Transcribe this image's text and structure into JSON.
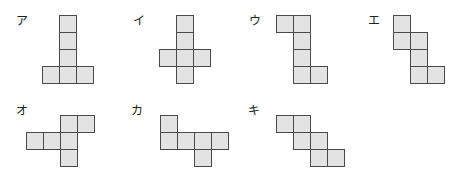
{
  "cell_size": 17,
  "fill_color": "#e3e3e3",
  "border_color": "#4a4a4a",
  "shapes": [
    {
      "label": "ア",
      "label_pos": [
        16,
        14
      ],
      "origin": [
        42,
        15
      ],
      "cells": [
        [
          1,
          0
        ],
        [
          1,
          1
        ],
        [
          1,
          2
        ],
        [
          0,
          3
        ],
        [
          1,
          3
        ],
        [
          2,
          3
        ]
      ]
    },
    {
      "label": "イ",
      "label_pos": [
        133,
        14
      ],
      "origin": [
        159,
        15
      ],
      "cells": [
        [
          1,
          0
        ],
        [
          1,
          1
        ],
        [
          0,
          2
        ],
        [
          1,
          2
        ],
        [
          2,
          2
        ],
        [
          1,
          3
        ]
      ]
    },
    {
      "label": "ウ",
      "label_pos": [
        249,
        14
      ],
      "origin": [
        276,
        15
      ],
      "cells": [
        [
          0,
          0
        ],
        [
          1,
          0
        ],
        [
          1,
          1
        ],
        [
          1,
          2
        ],
        [
          1,
          3
        ],
        [
          2,
          3
        ]
      ]
    },
    {
      "label": "エ",
      "label_pos": [
        368,
        14
      ],
      "origin": [
        393,
        15
      ],
      "cells": [
        [
          0,
          0
        ],
        [
          0,
          1
        ],
        [
          1,
          1
        ],
        [
          1,
          2
        ],
        [
          1,
          3
        ],
        [
          2,
          3
        ]
      ]
    },
    {
      "label": "オ",
      "label_pos": [
        16,
        104
      ],
      "origin": [
        26,
        115
      ],
      "cells": [
        [
          2,
          0
        ],
        [
          3,
          0
        ],
        [
          0,
          1
        ],
        [
          1,
          1
        ],
        [
          2,
          1
        ],
        [
          2,
          2
        ]
      ]
    },
    {
      "label": "カ",
      "label_pos": [
        131,
        104
      ],
      "origin": [
        160,
        115
      ],
      "cells": [
        [
          0,
          0
        ],
        [
          0,
          1
        ],
        [
          1,
          1
        ],
        [
          2,
          1
        ],
        [
          3,
          1
        ],
        [
          2,
          2
        ]
      ]
    },
    {
      "label": "キ",
      "label_pos": [
        248,
        104
      ],
      "origin": [
        276,
        115
      ],
      "cells": [
        [
          0,
          0
        ],
        [
          1,
          0
        ],
        [
          1,
          1
        ],
        [
          2,
          1
        ],
        [
          2,
          2
        ],
        [
          3,
          2
        ]
      ]
    }
  ]
}
